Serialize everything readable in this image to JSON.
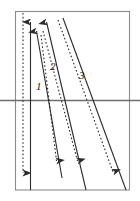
{
  "figure": {
    "type": "line-diagram",
    "background_color": "#ffffff",
    "canvas": {
      "width": 140,
      "height": 201
    }
  },
  "frame": {
    "name": "outer-rectangle",
    "x": 15,
    "y": 11,
    "width": 115,
    "height": 179,
    "stroke_color": "#8c8c8c",
    "stroke_width": 1.1
  },
  "horizontal_axis": {
    "name": "horizontal-reference-line",
    "y": 100,
    "x_start": 0,
    "x_end": 140,
    "stroke_color": "#6e6e6e",
    "stroke_width": 1.3
  },
  "vertical_lines": [
    {
      "name": "dotted-vertical-axis",
      "style": "dotted",
      "x": 23,
      "y_start": 13,
      "y_end": 180,
      "arrow": "down",
      "stroke_color": "#2b2b2b"
    },
    {
      "name": "solid-vertical-axis",
      "style": "solid",
      "x": 30.5,
      "y_start": 13,
      "y_end": 190,
      "arrow": "up",
      "stroke_color": "#2b2b2b"
    }
  ],
  "trajectories": [
    {
      "label": "1",
      "label_x": 37,
      "label_y": 82,
      "solid": {
        "x1": 36,
        "y1": 22,
        "x2": 62,
        "y2": 178,
        "arrow": "up"
      },
      "dotted": {
        "x1": 41,
        "y1": 35,
        "x2": 57,
        "y2": 170,
        "arrow": "down"
      },
      "stroke_color": "#2b2b2b"
    },
    {
      "label": "2",
      "label_x": 51,
      "label_y": 62,
      "solid": {
        "x1": 46,
        "y1": 13,
        "x2": 86,
        "y2": 190,
        "arrow": "up"
      },
      "dotted": {
        "x1": 42,
        "y1": 32,
        "x2": 78,
        "y2": 170,
        "arrow": "down"
      },
      "stroke_color": "#2b2b2b"
    },
    {
      "label": "3",
      "label_x": 79,
      "label_y": 70,
      "solid": {
        "x1": 63,
        "y1": 18,
        "x2": 126,
        "y2": 190,
        "arrow": "none"
      },
      "dotted": {
        "x1": 59,
        "y1": 20,
        "x2": 114,
        "y2": 181,
        "arrow": "down"
      },
      "stroke_color": "#2b2b2b"
    }
  ],
  "labels": {
    "one": "1",
    "two": "2",
    "three": "3"
  },
  "colors": {
    "ink": "#2b2b2b",
    "frame": "#8c8c8c",
    "axis": "#6e6e6e",
    "background": "#ffffff"
  }
}
